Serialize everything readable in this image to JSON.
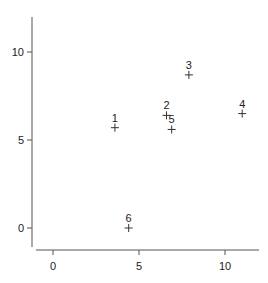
{
  "chart_data": {
    "type": "scatter",
    "title": "",
    "xlabel": "",
    "ylabel": "",
    "xlim": [
      -1.0,
      12.0
    ],
    "ylim": [
      -1.1,
      11.4
    ],
    "xticks": [
      0,
      5,
      10
    ],
    "yticks": [
      0,
      5,
      10
    ],
    "xtick_labels": [
      "0",
      "5",
      "10"
    ],
    "ytick_labels": [
      "0",
      "5",
      "10"
    ],
    "grid": false,
    "legend": null,
    "marker": "+",
    "points": [
      {
        "label": "1",
        "x": 3.6,
        "y": 5.7
      },
      {
        "label": "2",
        "x": 6.6,
        "y": 6.4
      },
      {
        "label": "3",
        "x": 7.9,
        "y": 8.7
      },
      {
        "label": "4",
        "x": 11.0,
        "y": 6.5
      },
      {
        "label": "5",
        "x": 6.9,
        "y": 5.6
      },
      {
        "label": "6",
        "x": 4.4,
        "y": 0.0
      }
    ]
  },
  "colors": {
    "axis": "#555555",
    "marker": "#333333",
    "text": "#222222",
    "background": "#ffffff"
  }
}
